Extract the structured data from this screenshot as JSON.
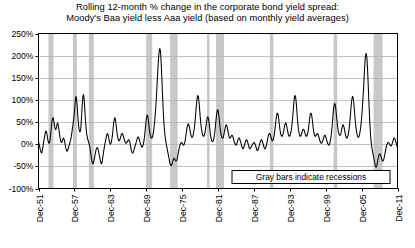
{
  "chart_data": {
    "type": "line",
    "title": "Rolling 12-month % change in the corporate bond yield spread:",
    "subtitle": "Moody's Baa yield less Aaa yield (based on monthly yield averages)",
    "xlabel": "",
    "ylabel": "",
    "ylim": [
      -100,
      250
    ],
    "ytick_values": [
      -100,
      -50,
      0,
      50,
      100,
      150,
      200,
      250
    ],
    "ytick_labels": [
      "-100%",
      "-50%",
      "0%",
      "50%",
      "100%",
      "150%",
      "200%",
      "250%"
    ],
    "xtick_labels": [
      "Dec-51",
      "Dec-57",
      "Dec-63",
      "Dec-69",
      "Dec-75",
      "Dec-81",
      "Dec-87",
      "Dec-93",
      "Dec-99",
      "Dec-05",
      "Dec-11"
    ],
    "xlim": [
      "Dec-51",
      "Dec-11"
    ],
    "grid": true,
    "legend_position": "inside-bottom-right",
    "annotation": "Gray bars indicate recessions",
    "series_name": "Rolling 12-month % change in Baa less Aaa spread",
    "line_color": "#000000",
    "recession_band_color": "#c8c8c8",
    "grid_color": "#b4b4b4",
    "axis_color": "#000000",
    "background_color": "#ffffff",
    "x_start_year": 1951.917,
    "x_end_year": 2011.917,
    "recessions": [
      [
        1953.583,
        1954.417
      ],
      [
        1957.667,
        1958.333
      ],
      [
        1960.333,
        1961.167
      ],
      [
        1969.917,
        1970.917
      ],
      [
        1973.917,
        1975.167
      ],
      [
        1980.083,
        1980.5
      ],
      [
        1981.583,
        1982.917
      ],
      [
        1990.583,
        1991.167
      ],
      [
        2001.25,
        2001.833
      ],
      [
        2007.917,
        2009.417
      ]
    ],
    "values": [
      5,
      2,
      -3,
      -9,
      -14,
      -18,
      -20,
      -18,
      -12,
      -5,
      3,
      10,
      16,
      22,
      27,
      30,
      28,
      22,
      14,
      8,
      4,
      2,
      4,
      9,
      18,
      30,
      42,
      52,
      58,
      60,
      57,
      50,
      42,
      36,
      33,
      34,
      38,
      44,
      48,
      46,
      40,
      32,
      24,
      16,
      10,
      6,
      4,
      5,
      8,
      12,
      14,
      12,
      8,
      2,
      -4,
      -10,
      -14,
      -16,
      -15,
      -12,
      -8,
      -4,
      0,
      4,
      8,
      13,
      20,
      28,
      36,
      44,
      52,
      62,
      74,
      88,
      100,
      108,
      104,
      92,
      76,
      60,
      46,
      36,
      30,
      28,
      30,
      40,
      58,
      78,
      96,
      108,
      112,
      106,
      92,
      74,
      56,
      40,
      28,
      20,
      14,
      10,
      6,
      2,
      -2,
      -8,
      -16,
      -24,
      -32,
      -38,
      -42,
      -44,
      -42,
      -38,
      -32,
      -26,
      -20,
      -14,
      -10,
      -8,
      -8,
      -10,
      -14,
      -20,
      -26,
      -32,
      -38,
      -42,
      -44,
      -42,
      -36,
      -28,
      -20,
      -12,
      -6,
      0,
      6,
      12,
      18,
      22,
      24,
      22,
      18,
      12,
      6,
      2,
      0,
      2,
      6,
      12,
      20,
      30,
      42,
      52,
      58,
      60,
      56,
      48,
      38,
      28,
      20,
      14,
      10,
      8,
      8,
      10,
      14,
      18,
      22,
      24,
      24,
      22,
      18,
      14,
      10,
      6,
      4,
      2,
      2,
      4,
      6,
      8,
      10,
      10,
      8,
      4,
      -2,
      -8,
      -14,
      -18,
      -20,
      -20,
      -18,
      -14,
      -10,
      -6,
      -2,
      2,
      6,
      10,
      14,
      16,
      16,
      14,
      10,
      6,
      2,
      -2,
      -4,
      -6,
      -6,
      -4,
      0,
      6,
      14,
      24,
      36,
      48,
      58,
      64,
      66,
      62,
      54,
      44,
      34,
      26,
      20,
      16,
      14,
      14,
      16,
      20,
      26,
      34,
      44,
      56,
      70,
      86,
      104,
      124,
      146,
      168,
      188,
      202,
      212,
      216,
      212,
      198,
      176,
      150,
      122,
      96,
      72,
      52,
      36,
      24,
      14,
      6,
      0,
      -6,
      -12,
      -18,
      -24,
      -30,
      -36,
      -42,
      -46,
      -48,
      -48,
      -46,
      -42,
      -38,
      -34,
      -32,
      -32,
      -34,
      -36,
      -38,
      -38,
      -36,
      -32,
      -26,
      -20,
      -14,
      -8,
      -4,
      0,
      2,
      4,
      4,
      2,
      0,
      -2,
      -2,
      0,
      4,
      10,
      18,
      26,
      34,
      40,
      44,
      46,
      44,
      40,
      34,
      28,
      22,
      18,
      16,
      16,
      18,
      22,
      28,
      36,
      46,
      58,
      72,
      86,
      98,
      106,
      110,
      108,
      100,
      88,
      74,
      60,
      48,
      38,
      30,
      24,
      20,
      18,
      18,
      20,
      24,
      30,
      38,
      46,
      54,
      60,
      62,
      60,
      54,
      46,
      36,
      26,
      18,
      12,
      8,
      6,
      6,
      8,
      12,
      18,
      26,
      36,
      48,
      60,
      70,
      76,
      78,
      74,
      66,
      56,
      44,
      34,
      26,
      20,
      16,
      14,
      14,
      16,
      20,
      26,
      32,
      38,
      42,
      44,
      42,
      38,
      32,
      26,
      20,
      16,
      14,
      14,
      16,
      18,
      20,
      20,
      18,
      14,
      10,
      6,
      2,
      0,
      -2,
      -2,
      0,
      4,
      8,
      12,
      14,
      14,
      12,
      8,
      4,
      0,
      -4,
      -8,
      -10,
      -10,
      -8,
      -4,
      0,
      4,
      8,
      10,
      10,
      8,
      4,
      0,
      -4,
      -8,
      -10,
      -10,
      -8,
      -6,
      -4,
      -2,
      0,
      2,
      4,
      4,
      2,
      0,
      -4,
      -8,
      -12,
      -14,
      -14,
      -12,
      -8,
      -4,
      0,
      4,
      8,
      10,
      10,
      8,
      4,
      0,
      -4,
      -8,
      -10,
      -10,
      -8,
      -4,
      0,
      6,
      12,
      18,
      22,
      24,
      24,
      22,
      18,
      14,
      10,
      8,
      8,
      10,
      14,
      20,
      28,
      38,
      48,
      58,
      66,
      70,
      70,
      66,
      58,
      48,
      38,
      30,
      24,
      20,
      18,
      18,
      20,
      24,
      30,
      36,
      42,
      46,
      48,
      46,
      42,
      36,
      30,
      24,
      20,
      18,
      18,
      20,
      24,
      30,
      38,
      48,
      60,
      74,
      88,
      100,
      108,
      110,
      106,
      96,
      82,
      66,
      52,
      40,
      30,
      24,
      20,
      18,
      18,
      20,
      24,
      28,
      32,
      34,
      34,
      32,
      28,
      24,
      20,
      18,
      18,
      20,
      24,
      30,
      38,
      48,
      58,
      66,
      70,
      70,
      66,
      58,
      48,
      38,
      30,
      24,
      20,
      18,
      18,
      20,
      22,
      24,
      24,
      22,
      18,
      14,
      10,
      6,
      4,
      2,
      2,
      4,
      6,
      10,
      14,
      18,
      20,
      20,
      18,
      14,
      10,
      6,
      2,
      0,
      -2,
      -2,
      0,
      4,
      10,
      18,
      28,
      40,
      54,
      68,
      80,
      88,
      92,
      90,
      84,
      74,
      62,
      50,
      40,
      32,
      26,
      22,
      20,
      20,
      22,
      26,
      32,
      38,
      42,
      44,
      42,
      38,
      32,
      26,
      20,
      16,
      14,
      14,
      16,
      20,
      26,
      34,
      44,
      56,
      70,
      84,
      96,
      104,
      108,
      106,
      98,
      86,
      72,
      58,
      46,
      36,
      28,
      22,
      18,
      16,
      16,
      18,
      22,
      28,
      36,
      46,
      58,
      72,
      88,
      106,
      126,
      148,
      170,
      188,
      200,
      205,
      202,
      190,
      170,
      144,
      116,
      88,
      62,
      40,
      22,
      8,
      -2,
      -10,
      -16,
      -22,
      -28,
      -34,
      -40,
      -46,
      -50,
      -52,
      -50,
      -46,
      -40,
      -34,
      -28,
      -24,
      -22,
      -22,
      -24,
      -28,
      -32,
      -36,
      -38,
      -38,
      -36,
      -32,
      -26,
      -20,
      -14,
      -8,
      -4,
      0,
      2,
      4,
      4,
      2,
      0,
      -2,
      -4,
      -4,
      -2,
      0,
      4,
      8,
      12,
      14,
      14,
      12,
      8,
      4,
      0,
      -4,
      -8
    ]
  }
}
